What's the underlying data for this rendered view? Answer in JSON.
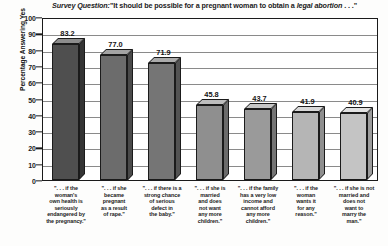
{
  "chart_data": {
    "type": "bar",
    "title_parts": {
      "lead_italic": "Survey Question:",
      "quote_open": "\"It should be possible for a pregnant woman to obtain a ",
      "emphasis_italic": "legal abortion",
      "quote_close": " . . .\""
    },
    "xlabel": "",
    "ylabel": "Percentage Answering Yes",
    "ylim": [
      0,
      100
    ],
    "ytick_step": 10,
    "yticks": [
      0,
      10,
      20,
      30,
      40,
      50,
      60,
      70,
      80,
      90,
      100
    ],
    "grid": true,
    "grid_axis": "y",
    "legend": false,
    "style": "3d-bar",
    "categories": [
      "\". . . if the woman's own health is seriously endangered by the pregnancy.\"",
      "\". . . if she became pregnant as a result of rape.\"",
      "\". . . if there is a strong chance of serious defect in the baby.\"",
      "\". . . if she is married and does not want any more children.\"",
      "\". . . if the family has a very low income and cannot afford any more children.\"",
      "\". . . if the woman wants it for any reason.\"",
      "\". . . if she is not married and does not want to marry the man.\""
    ],
    "category_lines": [
      [
        "\". . . if the",
        "woman's",
        "own health is",
        "seriously",
        "endangered by",
        "the pregnancy.\""
      ],
      [
        "\". . . if she",
        "became",
        "pregnant",
        "as a result",
        "of rape.\""
      ],
      [
        "\". . . if there is a",
        "strong chance",
        "of serious",
        "defect in",
        "the baby.\""
      ],
      [
        "\". . . if she is",
        "married",
        "and does",
        "not want",
        "any more",
        "children.\""
      ],
      [
        "\". . . if the family",
        "has a very low",
        "income and",
        "cannot afford",
        "any more",
        "children.\""
      ],
      [
        "\". . . if the",
        "woman",
        "wants it",
        "for any",
        "reason.\""
      ],
      [
        "\". . . if she is not",
        "married and",
        "does not",
        "want to",
        "marry the",
        "man.\""
      ]
    ],
    "values": [
      83.2,
      77.0,
      71.9,
      45.8,
      43.7,
      41.9,
      40.9
    ],
    "value_labels": [
      "83.2",
      "77.0",
      "71.9",
      "45.8",
      "43.7",
      "41.9",
      "40.9"
    ],
    "bar_colors": [
      {
        "front": "#4f4f4f",
        "top": "#8d8d8d",
        "side": "#343434"
      },
      {
        "front": "#6c6c6c",
        "top": "#a3a3a3",
        "side": "#4a4a4a"
      },
      {
        "front": "#757575",
        "top": "#ababab",
        "side": "#535353"
      },
      {
        "front": "#8f8f8f",
        "top": "#bdbdbd",
        "side": "#6b6b6b"
      },
      {
        "front": "#9a9a9a",
        "top": "#c6c6c6",
        "side": "#757575"
      },
      {
        "front": "#b5b5b5",
        "top": "#d8d8d8",
        "side": "#8f8f8f"
      },
      {
        "front": "#c4c4c4",
        "top": "#e2e2e2",
        "side": "#9d9d9d"
      }
    ]
  }
}
